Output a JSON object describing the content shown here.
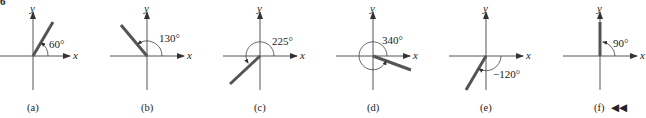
{
  "figure": {
    "corner_mark": "6",
    "axis_labels": {
      "x": "x",
      "y": "y"
    },
    "nav_icon": "rewind-double-left-icon",
    "nav_glyph": "◀◀",
    "colors": {
      "ray": "#555555",
      "axis": "#555555",
      "text": "#222222"
    },
    "panels": [
      {
        "caption": "(a)",
        "angle_label": "60°",
        "angle_deg": 60
      },
      {
        "caption": "(b)",
        "angle_label": "130°",
        "angle_deg": 130
      },
      {
        "caption": "(c)",
        "angle_label": "225°",
        "angle_deg": 225
      },
      {
        "caption": "(d)",
        "angle_label": "340°",
        "angle_deg": 340
      },
      {
        "caption": "(e)",
        "angle_label": "−120°",
        "angle_deg": -120
      },
      {
        "caption": "(f)",
        "angle_label": "90°",
        "angle_deg": 90
      }
    ]
  }
}
